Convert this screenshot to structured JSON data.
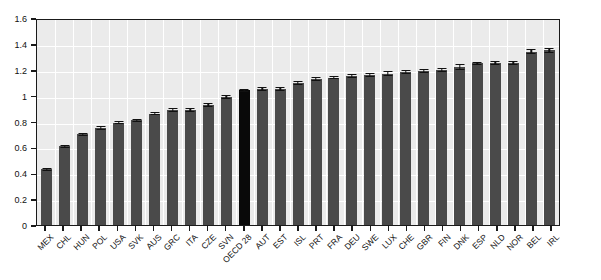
{
  "chart_data": {
    "type": "bar",
    "title": "",
    "subtitle": "",
    "xlabel": "",
    "ylabel": "",
    "ylim": [
      0,
      1.6
    ],
    "yticks": [
      "0",
      "0.2",
      "0.4",
      "0.6",
      "0.8",
      "1",
      "1.2",
      "1.4",
      "1.6"
    ],
    "ytick_values": [
      0,
      0.2,
      0.4,
      0.6,
      0.8,
      1.0,
      1.2,
      1.4,
      1.6
    ],
    "grid": true,
    "legend": "none",
    "categories": [
      "MEX",
      "CHL",
      "HUN",
      "POL",
      "USA",
      "SVK",
      "AUS",
      "GRC",
      "ITA",
      "CZE",
      "SVN",
      "OECD 28",
      "AUT",
      "EST",
      "ISL",
      "PRT",
      "FRA",
      "DEU",
      "SWE",
      "LUX",
      "CHE",
      "GBR",
      "FIN",
      "DNK",
      "ESP",
      "NLD",
      "NOR",
      "BEL",
      "IRL"
    ],
    "values": [
      0.43,
      0.61,
      0.7,
      0.75,
      0.79,
      0.81,
      0.86,
      0.89,
      0.89,
      0.93,
      0.99,
      1.04,
      1.05,
      1.05,
      1.1,
      1.13,
      1.14,
      1.15,
      1.16,
      1.17,
      1.18,
      1.19,
      1.2,
      1.22,
      1.25,
      1.25,
      1.25,
      1.34,
      1.35
    ],
    "errors": [
      0.012,
      0.012,
      0.012,
      0.012,
      0.012,
      0.012,
      0.013,
      0.015,
      0.013,
      0.014,
      0.013,
      0.01,
      0.016,
      0.016,
      0.015,
      0.016,
      0.014,
      0.016,
      0.014,
      0.019,
      0.016,
      0.016,
      0.016,
      0.022,
      0.013,
      0.014,
      0.015,
      0.02,
      0.018
    ],
    "highlight_category": "OECD 28",
    "colors": {
      "bar": "#4a4a4a",
      "bar_highlight": "#090909",
      "plot_background": "#ebebeb",
      "grid": "#ffffff",
      "axis": "#1a1a1a",
      "text": "#111111",
      "page_background": "#ffffff"
    }
  }
}
